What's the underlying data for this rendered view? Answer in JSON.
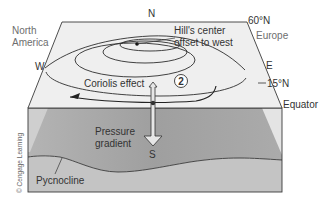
{
  "diagram": {
    "type": "ocean-gyre-block-diagram",
    "compass": {
      "north": "N",
      "south": "S",
      "east": "E",
      "west": "W"
    },
    "latitudes": {
      "top": "60°N",
      "middle": "15°N",
      "bottom": "Equator"
    },
    "continents": {
      "left": "North America",
      "left_line1": "North",
      "left_line2": "America",
      "right": "Europe"
    },
    "annotations": {
      "hill_center": "Hill's center offset to west",
      "hill_center_line1": "Hill's center",
      "hill_center_line2": "offset to west",
      "coriolis": "Coriolis effect",
      "step_number": "2",
      "pressure_gradient": "Pressure gradient",
      "pressure_line1": "Pressure",
      "pressure_line2": "gradient",
      "pycnocline": "Pycnocline"
    },
    "credit": "© Cengage Learning",
    "colors": {
      "top_surface": "#efefef",
      "front_face_upper": "#a9a9a9",
      "front_face_lower": "#c2c2c2",
      "outline": "#3a3a3a",
      "highlight": "#e9e9e9"
    }
  }
}
